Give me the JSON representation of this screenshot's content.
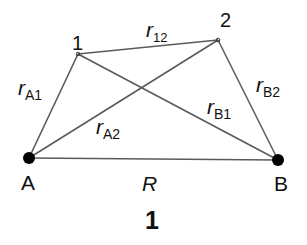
{
  "diagram": {
    "points": {
      "p1": {
        "label": "1",
        "x": 78,
        "y": 54
      },
      "p2": {
        "label": "2",
        "x": 218,
        "y": 40
      },
      "A": {
        "label": "A",
        "x": 29,
        "y": 158
      },
      "B": {
        "label": "B",
        "x": 278,
        "y": 160
      }
    },
    "edges": [
      {
        "from": "A",
        "to": "p1",
        "label": "r",
        "sub": "A1"
      },
      {
        "from": "A",
        "to": "p2",
        "label": "r",
        "sub": "A2"
      },
      {
        "from": "B",
        "to": "p1",
        "label": "r",
        "sub": "B1"
      },
      {
        "from": "B",
        "to": "p2",
        "label": "r",
        "sub": "B2"
      },
      {
        "from": "p1",
        "to": "p2",
        "label": "r",
        "sub": "12"
      },
      {
        "from": "A",
        "to": "B",
        "label": "R",
        "sub": ""
      }
    ],
    "labels": {
      "r12": {
        "main": "r",
        "sub": "12"
      },
      "rA1": {
        "main": "r",
        "sub": "A1"
      },
      "rA2": {
        "main": "r",
        "sub": "A2"
      },
      "rB1": {
        "main": "r",
        "sub": "B1"
      },
      "rB2": {
        "main": "r",
        "sub": "B2"
      },
      "R": "R",
      "A": "A",
      "B": "B",
      "p1": "1",
      "p2": "2"
    },
    "caption": "1",
    "line_color": "#555555",
    "dot_color": "#000000"
  }
}
